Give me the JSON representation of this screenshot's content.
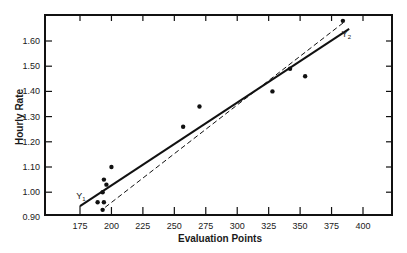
{
  "chart_data": {
    "type": "scatter",
    "title": "",
    "xlabel": "Evaluation Points",
    "ylabel": "Hourly Rate",
    "xlim": [
      175,
      415
    ],
    "ylim": [
      0.9,
      1.7
    ],
    "x_ticks": [
      175,
      200,
      225,
      250,
      275,
      300,
      325,
      350,
      375,
      400
    ],
    "x_tick_labels": [
      "175",
      "200",
      "225",
      "250",
      "275",
      "300",
      "325",
      "350",
      "375",
      "400"
    ],
    "y_ticks": [
      0.9,
      1.0,
      1.1,
      1.2,
      1.3,
      1.4,
      1.5,
      1.6
    ],
    "y_tick_labels": [
      "0.90",
      "1.00",
      "1.10",
      "1.20",
      "1.30",
      "1.40",
      "1.50",
      "1.60"
    ],
    "grid": false,
    "legend": null,
    "series": [
      {
        "name": "Observed rates",
        "kind": "points",
        "x": [
          200,
          194,
          196,
          193,
          189,
          194,
          193,
          257,
          270,
          328,
          342,
          354,
          384
        ],
        "y": [
          1.1,
          1.05,
          1.03,
          1.0,
          0.96,
          0.96,
          0.93,
          1.26,
          1.34,
          1.4,
          1.49,
          1.46,
          1.68
        ]
      },
      {
        "name": "Y1 (fitted line, solid)",
        "kind": "line",
        "style": "solid",
        "x": [
          175,
          389
        ],
        "y": [
          0.945,
          1.648
        ]
      },
      {
        "name": "Y2 (dashed line)",
        "kind": "line",
        "style": "dashed",
        "x": [
          195,
          385
        ],
        "y": [
          0.94,
          1.675
        ]
      }
    ],
    "annotations": [
      {
        "text": "Y",
        "sub": "1",
        "x": 172,
        "y": 0.975
      },
      {
        "text": "Y",
        "sub": "2",
        "x": 383,
        "y": 1.615
      }
    ]
  }
}
